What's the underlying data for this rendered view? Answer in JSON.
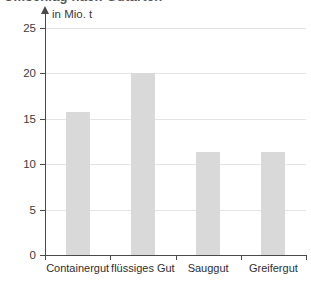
{
  "chart_data": {
    "type": "bar",
    "title": "",
    "xlabel": "",
    "ylabel": "in Mio. t",
    "unit_label": "in Mio. t",
    "categories": [
      "Containergut",
      "flüssiges Gut",
      "Sauggut",
      "Greifergut"
    ],
    "values": [
      15.7,
      20.0,
      11.3,
      11.3
    ],
    "ylim": [
      0,
      25
    ],
    "yticks": [
      0,
      5,
      10,
      15,
      20,
      25
    ],
    "ytick_labels": [
      "0",
      "5",
      "10",
      "15",
      "20",
      "25"
    ],
    "grid": true,
    "legend": "none",
    "bar_color": "#d9d9d9",
    "gridline_color": "#e4e4e4",
    "axis_color": "#4a4a4a",
    "text_color": "#3b3b3b"
  },
  "header": {
    "cropped_title": "Umschlag nach Gutarten"
  }
}
